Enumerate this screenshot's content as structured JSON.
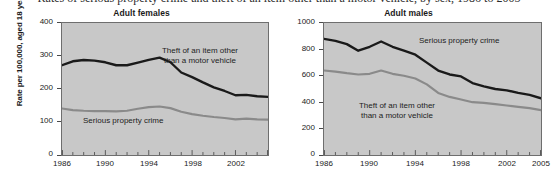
{
  "figure": {
    "cutoff_caption": "Rates of serious property crime and theft of an item other than a motor vehicle, by sex, 1986 to 2005",
    "y_axis_title": "Rate per 100,000, aged 18 years and older"
  },
  "colors": {
    "plot_background": "#c8c8c8",
    "page_background": "#ffffff",
    "series_dark": "#1a1a1a",
    "series_gray": "#8a8a8a",
    "axis": "#6e6e6e"
  },
  "labels": {
    "theft": "Theft of an item other",
    "theft_line2": "than a motor vehicle",
    "serious": "Serious property crime"
  },
  "chart_data": [
    {
      "type": "line",
      "title": "Adult females",
      "xlabel": "",
      "ylabel": "Rate per 100,000, aged 18 years and older",
      "xlim": [
        1986,
        2005
      ],
      "ylim": [
        0,
        400
      ],
      "yticks": [
        0,
        100,
        200,
        300,
        400
      ],
      "xticks_labeled": [
        1986,
        1990,
        1994,
        1998,
        2002,
        2005
      ],
      "xticks_all": [
        1986,
        1987,
        1988,
        1989,
        1990,
        1991,
        1992,
        1993,
        1994,
        1995,
        1996,
        1997,
        1998,
        1999,
        2000,
        2001,
        2002,
        2003,
        2004,
        2005
      ],
      "grid": false,
      "legend": "in-plot annotations",
      "x": [
        1986,
        1987,
        1988,
        1989,
        1990,
        1991,
        1992,
        1993,
        1994,
        1995,
        1996,
        1997,
        1998,
        1999,
        2000,
        2001,
        2002,
        2003,
        2004,
        2005
      ],
      "series": [
        {
          "name": "Theft of an item other than a motor vehicle",
          "color": "#1a1a1a",
          "values": [
            272,
            284,
            288,
            286,
            281,
            272,
            272,
            280,
            288,
            295,
            281,
            250,
            236,
            220,
            205,
            194,
            181,
            182,
            178,
            176
          ]
        },
        {
          "name": "Serious property crime",
          "color": "#8a8a8a",
          "values": [
            141,
            136,
            134,
            133,
            133,
            132,
            134,
            140,
            145,
            147,
            142,
            131,
            124,
            119,
            115,
            112,
            108,
            110,
            108,
            107
          ]
        }
      ]
    },
    {
      "type": "line",
      "title": "Adult males",
      "xlabel": "",
      "ylabel": "Rate per 100,000, aged 18 years and older",
      "xlim": [
        1986,
        2005
      ],
      "ylim": [
        0,
        1000
      ],
      "yticks": [
        0,
        200,
        400,
        600,
        800,
        1000
      ],
      "xticks_labeled": [
        1986,
        1990,
        1994,
        1998,
        2002,
        2005
      ],
      "xticks_all": [
        1986,
        1987,
        1988,
        1989,
        1990,
        1991,
        1992,
        1993,
        1994,
        1995,
        1996,
        1997,
        1998,
        1999,
        2000,
        2001,
        2002,
        2003,
        2004,
        2005
      ],
      "grid": false,
      "legend": "in-plot annotations",
      "x": [
        1986,
        1987,
        1988,
        1989,
        1990,
        1991,
        1992,
        1993,
        1994,
        1995,
        1996,
        1997,
        1998,
        1999,
        2000,
        2001,
        2002,
        2003,
        2004,
        2005
      ],
      "series": [
        {
          "name": "Serious property crime",
          "color": "#1a1a1a",
          "values": [
            880,
            865,
            840,
            790,
            820,
            860,
            820,
            790,
            760,
            700,
            640,
            610,
            595,
            545,
            520,
            500,
            490,
            470,
            455,
            430
          ]
        },
        {
          "name": "Theft of an item other than a motor vehicle",
          "color": "#8a8a8a",
          "values": [
            640,
            632,
            620,
            610,
            615,
            640,
            615,
            600,
            580,
            535,
            470,
            440,
            420,
            400,
            395,
            385,
            375,
            365,
            355,
            340
          ]
        }
      ]
    }
  ]
}
